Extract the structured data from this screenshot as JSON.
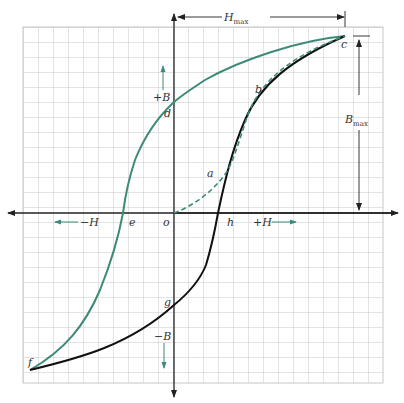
{
  "colors": {
    "grid": "#c8c8c8",
    "axis": "#222222",
    "green_curve": "#3d8a78",
    "black_curve": "#111111",
    "label": "#333333"
  },
  "grid": {
    "x0": 23,
    "y0": 27,
    "x1": 383,
    "y1": 383,
    "spacing": 15
  },
  "axes": {
    "origin": {
      "x": 174,
      "y": 213
    },
    "h_positive_label": "+H",
    "h_negative_label": "−H",
    "b_positive_label": "+B",
    "b_negative_label": "−B"
  },
  "dimensions": {
    "h_max": {
      "label": "H",
      "subscript": "max"
    },
    "b_max": {
      "label": "B",
      "subscript": "max"
    }
  },
  "points": {
    "o": "o",
    "a": "a",
    "b": "b",
    "c": "c",
    "d": "d",
    "e": "e",
    "f": "f",
    "g": "g",
    "h": "h"
  },
  "curves": [
    {
      "name": "initial magnetization",
      "path": "o-a-b-c",
      "style": "dashed",
      "color": "green"
    },
    {
      "name": "descending branch",
      "path": "c-d-e-f",
      "style": "solid",
      "color": "green"
    },
    {
      "name": "ascending branch",
      "path": "f-g-h-c",
      "style": "solid",
      "color": "black"
    }
  ]
}
